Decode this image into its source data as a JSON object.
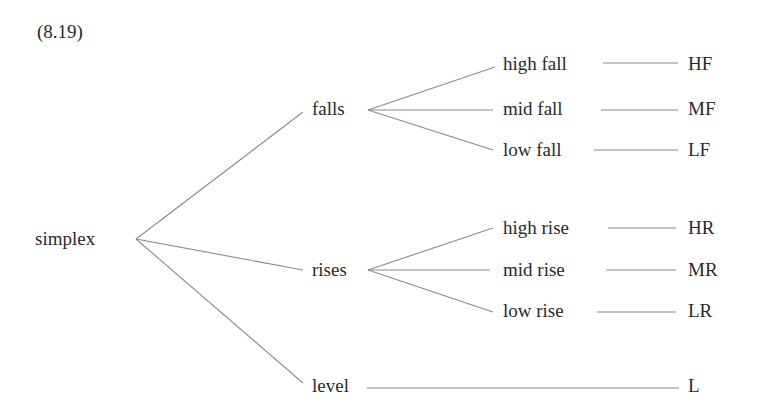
{
  "example_number": "(8.19)",
  "root": {
    "label": "simplex"
  },
  "branches": [
    {
      "label": "falls",
      "children": [
        {
          "label": "high fall",
          "code": "HF"
        },
        {
          "label": "mid fall",
          "code": "MF"
        },
        {
          "label": "low fall",
          "code": "LF"
        }
      ]
    },
    {
      "label": "rises",
      "children": [
        {
          "label": "high rise",
          "code": "HR"
        },
        {
          "label": "mid rise",
          "code": "MR"
        },
        {
          "label": "low rise",
          "code": "LR"
        }
      ]
    },
    {
      "label": "level",
      "code": "L"
    }
  ],
  "colors": {
    "text": "#2a2a2a",
    "line": "#8a8a8a",
    "background": "#ffffff"
  }
}
